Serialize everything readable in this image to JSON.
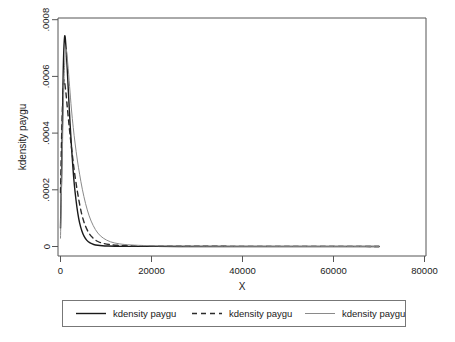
{
  "chart_data": {
    "type": "line",
    "title": "",
    "subtitle": "",
    "xlabel": "X",
    "ylabel": "kdensity paygu",
    "xlim": [
      0,
      80000
    ],
    "ylim": [
      0,
      0.0008
    ],
    "grid": false,
    "legend_position": "bottom",
    "x_ticks": [
      0,
      20000,
      40000,
      60000,
      80000
    ],
    "x_tick_labels": [
      "0",
      "20000",
      "40000",
      "60000",
      "80000"
    ],
    "y_ticks": [
      0,
      0.0002,
      0.0004,
      0.0006,
      0.0008
    ],
    "y_tick_labels": [
      "0",
      ".0002",
      ".0004",
      ".0006",
      ".0008"
    ],
    "series": [
      {
        "name": "kdensity paygu",
        "style": "solid",
        "color": "#1a1a1a",
        "width": 1.4,
        "x": [
          0,
          300,
          600,
          900,
          1200,
          1500,
          1800,
          2100,
          2400,
          2700,
          3000,
          3400,
          3800,
          4200,
          4700,
          5200,
          5800,
          6500,
          7300,
          8200,
          9200,
          10500,
          12000,
          14000,
          17000,
          21000,
          26000,
          32000,
          40000,
          50000,
          62000,
          70000
        ],
        "y": [
          6.5e-05,
          0.00031,
          0.00062,
          0.00074,
          0.000705,
          0.00062,
          0.000525,
          0.000435,
          0.000355,
          0.000285,
          0.000225,
          0.000165,
          0.000118,
          8.35e-05,
          5.45e-05,
          3.55e-05,
          2.15e-05,
          1.25e-05,
          7.2e-06,
          4.2e-06,
          2.5e-06,
          1.5e-06,
          9e-07,
          6e-07,
          4e-07,
          3e-07,
          2e-07,
          1.5e-07,
          1e-07,
          8e-08,
          5e-08,
          4e-08
        ]
      },
      {
        "name": "kdensity paygu",
        "style": "dashed",
        "color": "#2b2b2b",
        "width": 1.4,
        "x": [
          0,
          300,
          700,
          1100,
          1500,
          1900,
          2300,
          2700,
          3100,
          3600,
          4100,
          4700,
          5400,
          6200,
          7100,
          8100,
          9300,
          10800,
          12600,
          15000,
          18500,
          23000,
          28000,
          34000,
          42000,
          52000,
          62000,
          70000
        ],
        "y": [
          0.00019,
          0.00042,
          0.00058,
          0.000555,
          0.00049,
          0.000425,
          0.000365,
          0.00031,
          0.000258,
          0.000205,
          0.000158,
          0.000112,
          7.55e-05,
          4.85e-05,
          3.05e-05,
          1.85e-05,
          1.12e-05,
          6.8e-06,
          4.2e-06,
          2.7e-06,
          1.8e-06,
          1.2e-06,
          9e-07,
          7e-07,
          5e-07,
          4e-07,
          3e-07,
          2.5e-07
        ]
      },
      {
        "name": "kdensity paygu",
        "style": "solid-light",
        "color": "#8a8a8a",
        "width": 1.0,
        "x": [
          0,
          400,
          800,
          1200,
          1600,
          2000,
          2400,
          2800,
          3200,
          3700,
          4200,
          4800,
          5500,
          6300,
          7200,
          8200,
          9400,
          11000,
          13000,
          15500,
          19000,
          24000,
          30000,
          38000,
          48000,
          60000,
          70000
        ],
        "y": [
          2.95e-05,
          0.00033,
          0.0006,
          0.000695,
          0.000645,
          0.000565,
          0.000485,
          0.00042,
          0.000365,
          0.000305,
          0.000255,
          0.000202,
          0.000152,
          0.000108,
          7.35e-05,
          4.75e-05,
          2.95e-05,
          1.65e-05,
          9.2e-06,
          5.5e-06,
          3.2e-06,
          1.9e-06,
          1.2e-06,
          8e-07,
          5e-07,
          4e-07,
          3e-07
        ]
      }
    ],
    "legend_entries": [
      {
        "label": "kdensity paygu",
        "style": "solid",
        "color": "#1a1a1a"
      },
      {
        "label": "kdensity paygu",
        "style": "dashed",
        "color": "#2b2b2b"
      },
      {
        "label": "kdensity paygu",
        "style": "solid-light",
        "color": "#8a8a8a"
      }
    ]
  },
  "axes": {
    "x_title": "X",
    "y_title": "kdensity paygu"
  },
  "x_tick_labels": {
    "t0": "0",
    "t1": "20000",
    "t2": "40000",
    "t3": "60000",
    "t4": "80000"
  },
  "y_tick_labels": {
    "t0": "0",
    "t1": ".0002",
    "t2": ".0004",
    "t3": ".0006",
    "t4": ".0008"
  },
  "legend": {
    "item0": "kdensity paygu",
    "item1": "kdensity paygu",
    "item2": "kdensity paygu"
  },
  "colors": {
    "frame": "#555555",
    "text": "#1a1a1a",
    "series_solid": "#1a1a1a",
    "series_dashed": "#2b2b2b",
    "series_light": "#8a8a8a",
    "background": "#ffffff"
  }
}
